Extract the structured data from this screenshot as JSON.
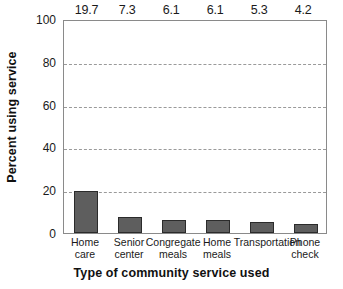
{
  "chart_data": {
    "type": "bar",
    "title": "",
    "xlabel": "Type of community service used",
    "ylabel": "Percent using service",
    "categories": [
      "Home care",
      "Senior center",
      "Congregate meals",
      "Home meals",
      "Transportation",
      "Phone check"
    ],
    "category_lines": [
      [
        "Home",
        "care"
      ],
      [
        "Senior",
        "center"
      ],
      [
        "Congregate",
        "meals"
      ],
      [
        "Home",
        "meals"
      ],
      [
        "Transportation",
        ""
      ],
      [
        "Phone",
        "check"
      ]
    ],
    "values": [
      19.7,
      7.3,
      6.1,
      6.1,
      5.3,
      4.2
    ],
    "value_labels": [
      "19.7",
      "7.3",
      "6.1",
      "6.1",
      "5.3",
      "4.2"
    ],
    "ylim": [
      0,
      100
    ],
    "yticks": [
      0,
      20,
      40,
      60,
      80,
      100
    ],
    "ytick_labels": [
      "0",
      "20",
      "40",
      "60",
      "80",
      "100"
    ],
    "gridlines_at": [
      20,
      40,
      60,
      80
    ],
    "grid": true,
    "grid_style": "dashed",
    "legend": false,
    "legend_position": "none",
    "bar_fill_color": "#5e5e5e",
    "bar_edge_color": "#2b2b2b",
    "grid_color": "#9a9a9a",
    "frame_color": "#8a8a8a",
    "background_color": "#ffffff",
    "text_color": "#1a1a1a"
  }
}
